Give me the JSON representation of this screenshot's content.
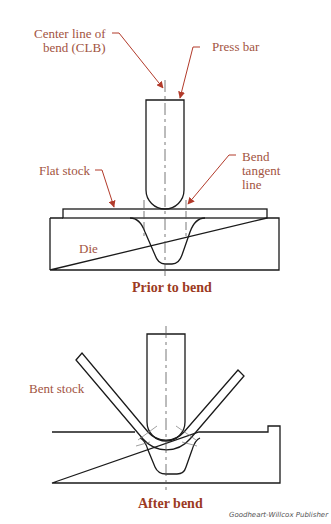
{
  "figure": {
    "top_diagram": {
      "caption": "Prior to bend",
      "labels": {
        "clb_line1": "Center line of",
        "clb_line2": "bend (CLB)",
        "press_bar": "Press bar",
        "flat_stock": "Flat stock",
        "bend_tangent_line1": "Bend",
        "bend_tangent_line2": "tangent",
        "bend_tangent_line3": "line",
        "die": "Die"
      }
    },
    "bottom_diagram": {
      "caption": "After bend",
      "labels": {
        "bent_stock": "Bent stock"
      }
    },
    "credit": "Goodheart-Willcox Publisher",
    "colors": {
      "label": "#a2543f",
      "caption": "#9c3a22",
      "arrow": "#b23a2a",
      "line": "#1a1a1a"
    }
  }
}
